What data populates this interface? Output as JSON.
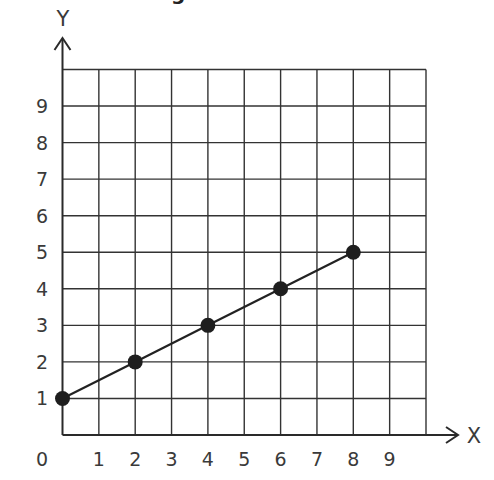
{
  "title_fragment": "g",
  "chart_data": {
    "type": "line",
    "title": "",
    "xlabel": "X",
    "ylabel": "Y",
    "x": [
      0,
      2,
      4,
      6,
      8
    ],
    "series": [
      {
        "name": "line",
        "values": [
          1,
          2,
          3,
          4,
          5
        ]
      }
    ],
    "xlim": [
      0,
      10
    ],
    "ylim": [
      0,
      10
    ],
    "x_tick_labels": [
      "0",
      "1",
      "2",
      "3",
      "4",
      "5",
      "6",
      "7",
      "8",
      "9"
    ],
    "y_tick_labels": [
      "1",
      "2",
      "3",
      "4",
      "5",
      "6",
      "7",
      "8",
      "9"
    ],
    "grid": true,
    "markers": "filled-circle",
    "colors": {
      "line": "#222222",
      "grid": "#333333",
      "background": "#ffffff"
    }
  }
}
